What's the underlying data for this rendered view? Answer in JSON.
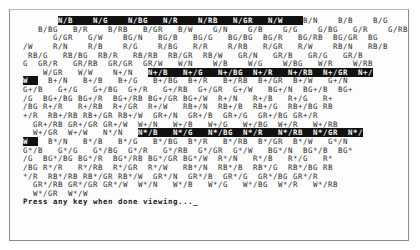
{
  "screen": {
    "columns": 80,
    "slot_width": 7,
    "colors": {
      "text": "#2a2a2a",
      "highlight_bg": "#111111",
      "highlight_fg": "#f4f4f4",
      "frame": "#8a8a8a"
    },
    "color_codes": [
      "N",
      "B",
      "G",
      "BG",
      "R",
      "RB",
      "GR",
      "W"
    ],
    "intensity_groups": [
      {
        "suffix": "",
        "label": "normal"
      },
      {
        "suffix": "+",
        "label": "bright"
      },
      {
        "suffix": "*",
        "label": "blink"
      }
    ],
    "lines": [
      [
        {
          "t": "       "
        },
        {
          "t": "N/B    N/G    N/BG   N/R    N/RB   N/GR   N/W    ",
          "hl": true
        },
        {
          "t": "B/N    B/B    B/G    "
        }
      ],
      [
        {
          "t": "   B/BG   B/R    B/RB   B/GR   B/W    G/N    G/B    G/G    G/BG   G/R    G/RB"
        }
      ],
      [
        {
          "t": "      G/GR   G/W    BG/N   BG/B   BG/G   BG/BG  BG/R   BG/RB  BG/GR  BG"
        }
      ],
      [
        {
          "t": "/W    R/N    R/B    R/G    R/BG   R/R    R/RB   R/GR   R/W    RB/N   RB/B"
        }
      ],
      [
        {
          "t": " RB/G   RB/BG  RB/R   RB/RB  RB/GR  RB/W   GR/N   GR/B   GR/G   GR/B"
        }
      ],
      [
        {
          "t": "G  GR/R   GR/RB  GR/GR  GR/W   W/N    W/B    W/G    W/BG   W/R    W/RB"
        }
      ],
      [
        {
          "t": "    W/GR   W/W    N+/N   "
        },
        {
          "t": "N+/B   N+/G   N+/BG  N+/R   N+/RB  N+/GR  N+/",
          "hl": true
        }
      ],
      [
        {
          "t": "W  ",
          "hl": true
        },
        {
          "t": "  B+/N   B+/B   B+/G   B+/BG  B+/R   B+/RB  B+/GR  B+/W   G+/N"
        }
      ],
      [
        {
          "t": "G+/B   G+/G   G+/BG  G+/R   G+/RB  G+/GR  G+/W   BG+/N  BG+/B  BG+"
        }
      ],
      [
        {
          "t": "/G  BG+/BG BG+/R  BG+/RB BG+/GR BG+/W  R+/N   R+/B   R+/G   R+"
        }
      ],
      [
        {
          "t": "/BG R+/R   R+/RB  R+/GR  R+/W   RB+/N  RB+/B  RB+/G  RB+/BG RB"
        }
      ],
      [
        {
          "t": "+/R  RB+/RB RB+/GR RB+/W  GR+/N  GR+/B  GR+/G  GR+/BG GR+/R"
        }
      ],
      [
        {
          "t": "  GR+/RB GR+/GR GR+/W  W+/N   W+/B   W+/G   W+/BG  W+/R   W+/RB"
        }
      ],
      [
        {
          "t": "  W+/GR  W+/W   N*/N   "
        },
        {
          "t": "N*/B   N*/G   N*/BG  N*/R   N*/RB  N*/GR  N*/",
          "hl": true
        }
      ],
      [
        {
          "t": "W  ",
          "hl": true
        },
        {
          "t": "  B*/N   B*/B   B*/G   B*/BG  B*/R   B*/RB  B*/GR  B*/W   G*/N"
        }
      ],
      [
        {
          "t": "G*/B   G*/G   G*/BG  G*/R   G*/RB  G*/GR  G*/W   BG*/N  BG*/B  BG*"
        }
      ],
      [
        {
          "t": "/G  BG*/BG BG*/R  BG*/RB BG*/GR BG*/W  R*/N   R*/B   R*/G   R*"
        }
      ],
      [
        {
          "t": "/BG R*/R   R*/RB  R*/GR  R*/W   RB*/N  RB*/B  RB*/G  RB*/BG RB"
        }
      ],
      [
        {
          "t": "*/R  RB*/RB RB*/GR RB*/W  GR*/N  GR*/B  GR*/G  GR*/BG GR*/R"
        }
      ],
      [
        {
          "t": "  GR*/RB GR*/GR GR*/W  W*/N   W*/B   W*/G   W*/BG  W*/R   W*/RB"
        }
      ],
      [
        {
          "t": "  W*/GR  W*/W"
        }
      ]
    ],
    "prompt": "Press any key when done viewing..._"
  }
}
